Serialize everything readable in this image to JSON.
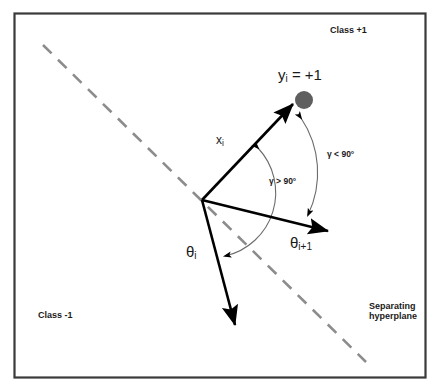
{
  "figure": {
    "type": "vector-geometry-diagram",
    "title_text": null,
    "border_color": "#3a3a3a",
    "background_color": "#ffffff",
    "width": 440,
    "height": 392
  },
  "labels": {
    "class_positive": "Class +1",
    "class_negative": "Class -1",
    "separating_hyperplane_line1": "Separating",
    "separating_hyperplane_line2": "hyperplane",
    "point_label_main": "y",
    "point_label_sub": "i",
    "point_label_tail": " = +1",
    "vector_x_main": "x",
    "vector_x_sub": "i",
    "theta_i_main": "θ",
    "theta_i_sub": "i",
    "theta_i1_main": "θ",
    "theta_i1_sub": "i+1",
    "gamma_less": "γ < 90°",
    "gamma_greater": "γ > 90°"
  },
  "colors": {
    "vector_stroke": "#000000",
    "arc_stroke": "#6b6b6b",
    "dashed_line": "#8c8c8c",
    "data_point_fill": "#5f5f5f",
    "text": "#1a1a1a",
    "frame": "#3a3a3a"
  },
  "geometry": {
    "origin": {
      "x": 202,
      "y": 200
    },
    "vectors": [
      {
        "name": "x_i",
        "tip_x": 294,
        "tip_y": 104,
        "label": "x_i"
      },
      {
        "name": "theta_i_plus_1",
        "tip_x": 330,
        "tip_y": 232,
        "label": "theta_i+1"
      },
      {
        "name": "theta_i",
        "tip_x": 236,
        "tip_y": 327,
        "label": "theta_i"
      }
    ],
    "data_point": {
      "x": 304,
      "y": 100,
      "radius": 9
    },
    "dashed_line": {
      "x1": 43,
      "y1": 45,
      "x2": 366,
      "y2": 362
    },
    "arcs": [
      {
        "name": "gamma-less-than-90",
        "label": "γ < 90°",
        "from_vector": "x_i",
        "to_vector": "theta_i_plus_1"
      },
      {
        "name": "gamma-greater-than-90",
        "label": "γ > 90°",
        "from_vector": "x_i",
        "to_vector": "theta_i"
      }
    ]
  }
}
